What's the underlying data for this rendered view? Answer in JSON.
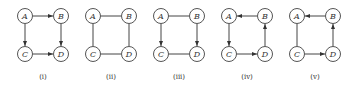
{
  "figure": {
    "colors": {
      "node_stroke": "#555555",
      "edge": "#444444",
      "text": "#333333",
      "background": "#ffffff"
    },
    "graphs": [
      {
        "caption": "(i)",
        "nodes": [
          "A",
          "B",
          "C",
          "D"
        ],
        "edges": [
          {
            "from": "A",
            "to": "B",
            "directed": true
          },
          {
            "from": "A",
            "to": "C",
            "directed": true
          },
          {
            "from": "B",
            "to": "D",
            "directed": true
          },
          {
            "from": "C",
            "to": "D",
            "directed": true
          }
        ]
      },
      {
        "caption": "(ii)",
        "nodes": [
          "A",
          "B",
          "C",
          "D"
        ],
        "edges": [
          {
            "from": "A",
            "to": "B",
            "directed": false
          },
          {
            "from": "A",
            "to": "C",
            "directed": false
          },
          {
            "from": "B",
            "to": "D",
            "directed": false
          },
          {
            "from": "C",
            "to": "D",
            "directed": false
          }
        ]
      },
      {
        "caption": "(iii)",
        "nodes": [
          "A",
          "B",
          "C",
          "D"
        ],
        "edges": [
          {
            "from": "A",
            "to": "B",
            "directed": false
          },
          {
            "from": "A",
            "to": "C",
            "directed": true
          },
          {
            "from": "B",
            "to": "D",
            "directed": true
          },
          {
            "from": "C",
            "to": "D",
            "directed": false
          }
        ]
      },
      {
        "caption": "(iv)",
        "nodes": [
          "A",
          "B",
          "C",
          "D"
        ],
        "edges": [
          {
            "from": "B",
            "to": "A",
            "directed": true
          },
          {
            "from": "A",
            "to": "C",
            "directed": true
          },
          {
            "from": "C",
            "to": "D",
            "directed": true
          },
          {
            "from": "D",
            "to": "B",
            "directed": true
          }
        ]
      },
      {
        "caption": "(v)",
        "nodes": [
          "A",
          "B",
          "C",
          "D"
        ],
        "edges": [
          {
            "from": "B",
            "to": "A",
            "directed": true
          },
          {
            "from": "A",
            "to": "C",
            "directed": false
          },
          {
            "from": "C",
            "to": "D",
            "directed": true
          },
          {
            "from": "D",
            "to": "B",
            "directed": true
          }
        ]
      }
    ]
  }
}
